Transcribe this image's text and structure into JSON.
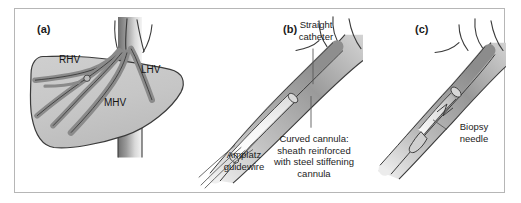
{
  "figure": {
    "border_color": "#b6b6b6",
    "background": "#ffffff",
    "organ_fill": "#c9c9c9",
    "vessel_fill": "#8f8f8f",
    "device_fill": "#9a9a9a",
    "outline_color": "#3a3a3a"
  },
  "panels": [
    {
      "id": "a",
      "label": "(a)",
      "subject": "liver-with-hepatic-veins",
      "labels": [
        {
          "name": "right-hepatic-vein",
          "text": "RHV"
        },
        {
          "name": "left-hepatic-vein",
          "text": "LHV"
        },
        {
          "name": "middle-hepatic-vein",
          "text": "MHV"
        }
      ]
    },
    {
      "id": "b",
      "label": "(b)",
      "subject": "curved-cannula-with-catheter-and-guidewire",
      "labels": [
        {
          "name": "straight-catheter",
          "text": "Straight\ncatheter"
        },
        {
          "name": "amplatz-guidewire",
          "text": "Amplatz\nguidewire"
        },
        {
          "name": "curved-cannula",
          "text": "Curved cannula:\nsheath reinforced\nwith steel stiffening\ncannula"
        }
      ]
    },
    {
      "id": "c",
      "label": "(c)",
      "subject": "biopsy-needle-deployed-from-cannula",
      "labels": [
        {
          "name": "biopsy-needle",
          "text": "Biopsy\nneedle"
        }
      ]
    }
  ]
}
